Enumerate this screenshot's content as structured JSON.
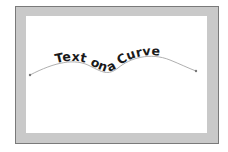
{
  "artwork": {
    "text": "Text on a Curve",
    "colors": {
      "frame": "#c9c9c9",
      "frame_border": "#7a7a7a",
      "canvas": "#ffffff",
      "path_stroke": "#9a9a9a",
      "text": "#1a1a1a"
    }
  }
}
